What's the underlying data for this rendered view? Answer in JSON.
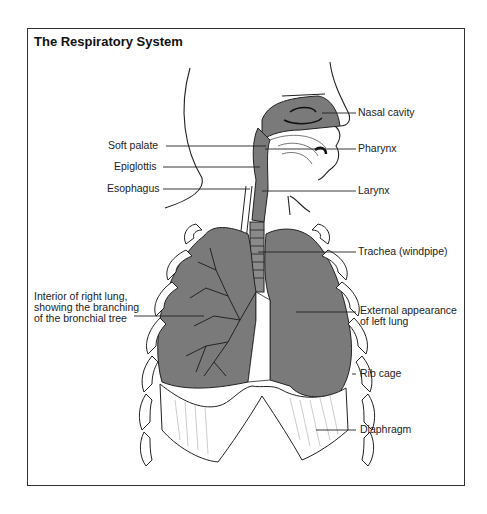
{
  "title": "The Respiratory System",
  "labels": {
    "nasal_cavity": "Nasal cavity",
    "soft_palate": "Soft palate",
    "pharynx": "Pharynx",
    "epiglottis": "Epiglottis",
    "esophagus": "Esophagus",
    "larynx": "Larynx",
    "trachea": "Trachea (windpipe)",
    "right_lung_line1": "Interior of right lung,",
    "right_lung_line2": "showing the branching",
    "right_lung_line3": "of the bronchial tree",
    "left_lung_line1": "External appearance",
    "left_lung_line2": "of left lung",
    "rib_cage": "Rib cage",
    "diaphragm": "Diaphragm"
  },
  "colors": {
    "lung_fill": "#7a7a7a",
    "cavity_fill": "#7a7a7a",
    "line": "#222222",
    "background": "#ffffff"
  }
}
